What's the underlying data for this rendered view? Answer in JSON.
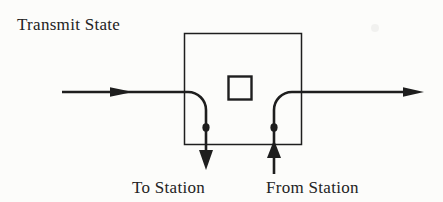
{
  "figure": {
    "title": "Transmit State",
    "labels": {
      "to_station": "To Station",
      "from_station": "From Station"
    },
    "colors": {
      "ink": "#1e1e1e",
      "paper": "#fcfcfa"
    },
    "diagram": {
      "type": "flow-diagram",
      "elements": [
        "input-line-arrow",
        "switch-box",
        "inner-square",
        "junction-dot-left",
        "junction-dot-right",
        "to-station-down-arrow",
        "from-station-up-arrow",
        "output-line-arrow"
      ]
    }
  }
}
